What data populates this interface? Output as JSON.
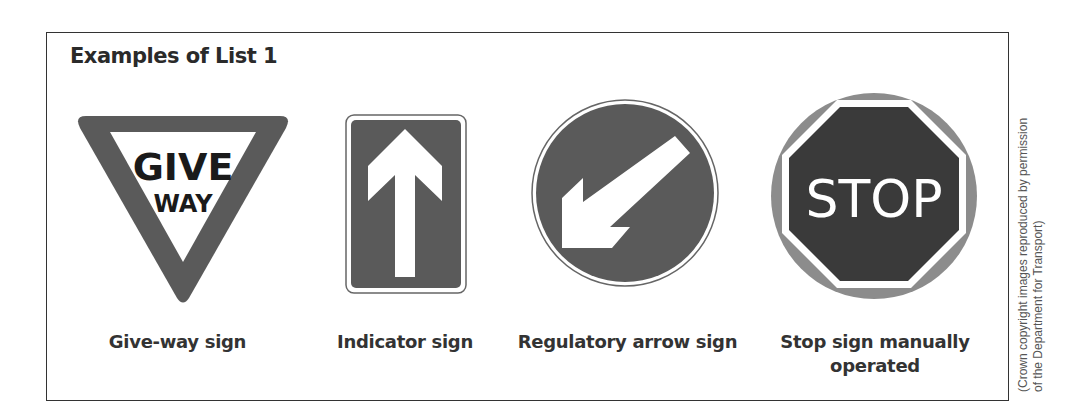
{
  "heading": "Examples of List 1",
  "signs": [
    {
      "name": "give-way",
      "caption": "Give-way sign",
      "text_line1": "GIVE",
      "text_line2": "WAY"
    },
    {
      "name": "indicator",
      "caption": "Indicator sign"
    },
    {
      "name": "regulatory-arrow",
      "caption": "Regulatory arrow sign"
    },
    {
      "name": "stop-manual",
      "caption_line1": "Stop sign manually",
      "caption_line2": "operated",
      "text": "STOP"
    }
  ],
  "credit": {
    "line1": "(Crown copyright images reproduced by permission",
    "line2": "of the Department for Transport)"
  },
  "colors": {
    "sign_dark": "#5a5a5a",
    "stop_dark": "#3a3a3a",
    "stop_ring": "#8c8c8c",
    "frame": "#333333"
  }
}
